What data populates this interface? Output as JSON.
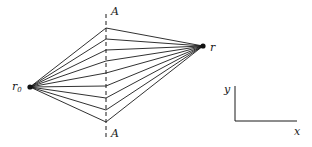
{
  "diagram": {
    "type": "ray-paths",
    "source_point": {
      "label": "r",
      "subscript": "0",
      "x": 30,
      "y": 87
    },
    "target_point": {
      "label": "r",
      "x": 203,
      "y": 46
    },
    "dashed_line": {
      "label_top": "A",
      "label_bottom": "A",
      "x": 106,
      "y_top": 14,
      "y_bottom": 140
    },
    "crossings_y": [
      28,
      39,
      50,
      61,
      73,
      86,
      98,
      110,
      122
    ],
    "axes": {
      "y_label": "y",
      "x_label": "x",
      "origin": {
        "x": 235,
        "y": 121
      },
      "x_end": 297,
      "y_end": 86
    },
    "line_color": "#1a1a1a"
  }
}
